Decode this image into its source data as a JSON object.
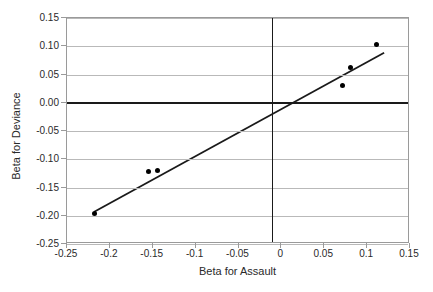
{
  "chart_data": {
    "type": "scatter",
    "title": "",
    "xlabel": "Beta for Assault",
    "ylabel": "Beta for Deviance",
    "xlim": [
      -0.25,
      0.15
    ],
    "ylim": [
      -0.25,
      0.15
    ],
    "xticks": [
      "-0.25",
      "-0.2",
      "-0.15",
      "-0.1",
      "-0.05",
      "0",
      "0.05",
      "0.1",
      "0.15"
    ],
    "xtick_values": [
      -0.25,
      -0.2,
      -0.15,
      -0.1,
      -0.05,
      0,
      0.05,
      0.1,
      0.15
    ],
    "yticks": [
      "0.15",
      "0.10",
      "0.05",
      "0.00",
      "-0.05",
      "-0.10",
      "-0.15",
      "-0.20",
      "-0.25"
    ],
    "ytick_values": [
      0.15,
      0.1,
      0.05,
      0.0,
      -0.05,
      -0.1,
      -0.15,
      -0.2,
      -0.25
    ],
    "grid": "horizontal",
    "legend": "none",
    "points": [
      {
        "x": -0.218,
        "y": -0.196
      },
      {
        "x": -0.155,
        "y": -0.121
      },
      {
        "x": -0.145,
        "y": -0.12
      },
      {
        "x": 0.071,
        "y": 0.03
      },
      {
        "x": 0.081,
        "y": 0.062
      },
      {
        "x": 0.111,
        "y": 0.103
      }
    ],
    "trend_line": {
      "type": "linear-fit",
      "x_start": -0.218,
      "y_start": -0.196,
      "x_end": 0.122,
      "y_end": 0.088
    },
    "zero_axis_h": 0.0,
    "zero_axis_v": -0.011,
    "colors": {
      "point": "#000000",
      "line": "#1a1a1a",
      "grid": "#b9b9b9",
      "frame": "#9a9a9a",
      "axis": "#1a1a1a",
      "text": "#2a2a2a",
      "background": "#ffffff"
    }
  }
}
